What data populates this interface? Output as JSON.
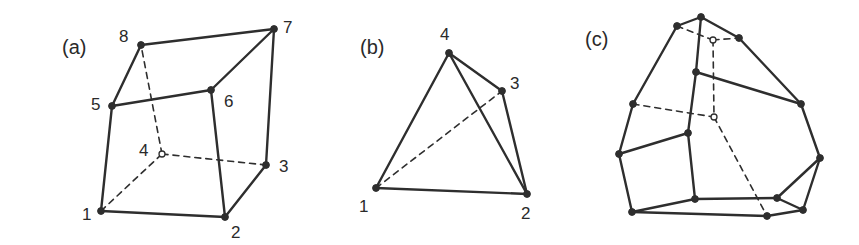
{
  "figure": {
    "stroke_color": "#2e2e2e",
    "panels": [
      {
        "id": "a",
        "label": "(a)",
        "label_pos": [
          62,
          54
        ],
        "shape": "hexahedron",
        "vertices": [
          {
            "id": "1",
            "x": 101,
            "y": 211,
            "hollow": false,
            "label": "1",
            "lx": 82,
            "ly": 220
          },
          {
            "id": "2",
            "x": 225,
            "y": 217,
            "hollow": false,
            "label": "2",
            "lx": 231,
            "ly": 238
          },
          {
            "id": "3",
            "x": 266,
            "y": 165,
            "hollow": false,
            "label": "3",
            "lx": 279,
            "ly": 172
          },
          {
            "id": "4",
            "x": 162,
            "y": 154,
            "hollow": true,
            "label": "4",
            "lx": 139,
            "ly": 156
          },
          {
            "id": "5",
            "x": 112,
            "y": 106,
            "hollow": false,
            "label": "5",
            "lx": 91,
            "ly": 110
          },
          {
            "id": "6",
            "x": 211,
            "y": 90,
            "hollow": false,
            "label": "6",
            "lx": 224,
            "ly": 107
          },
          {
            "id": "7",
            "x": 274,
            "y": 29,
            "hollow": false,
            "label": "7",
            "lx": 283,
            "ly": 33
          },
          {
            "id": "8",
            "x": 141,
            "y": 45,
            "hollow": false,
            "label": "8",
            "lx": 119,
            "ly": 42
          }
        ],
        "edges": [
          {
            "from": "1",
            "to": "2",
            "dashed": false
          },
          {
            "from": "2",
            "to": "3",
            "dashed": false
          },
          {
            "from": "1",
            "to": "5",
            "dashed": false
          },
          {
            "from": "2",
            "to": "6",
            "dashed": false
          },
          {
            "from": "3",
            "to": "7",
            "dashed": false
          },
          {
            "from": "5",
            "to": "6",
            "dashed": false
          },
          {
            "from": "6",
            "to": "7",
            "dashed": false
          },
          {
            "from": "7",
            "to": "8",
            "dashed": false
          },
          {
            "from": "8",
            "to": "5",
            "dashed": false
          },
          {
            "from": "1",
            "to": "4",
            "dashed": true
          },
          {
            "from": "4",
            "to": "3",
            "dashed": true
          },
          {
            "from": "4",
            "to": "8",
            "dashed": true
          }
        ]
      },
      {
        "id": "b",
        "label": "(b)",
        "label_pos": [
          360,
          54
        ],
        "shape": "tetrahedron",
        "vertices": [
          {
            "id": "1",
            "x": 376,
            "y": 188,
            "hollow": false,
            "label": "1",
            "lx": 359,
            "ly": 212
          },
          {
            "id": "2",
            "x": 527,
            "y": 194,
            "hollow": false,
            "label": "2",
            "lx": 521,
            "ly": 219
          },
          {
            "id": "3",
            "x": 502,
            "y": 91,
            "hollow": false,
            "label": "3",
            "lx": 510,
            "ly": 89
          },
          {
            "id": "4",
            "x": 449,
            "y": 53,
            "hollow": false,
            "label": "4",
            "lx": 440,
            "ly": 40
          }
        ],
        "edges": [
          {
            "from": "1",
            "to": "2",
            "dashed": false
          },
          {
            "from": "1",
            "to": "4",
            "dashed": false
          },
          {
            "from": "4",
            "to": "2",
            "dashed": false
          },
          {
            "from": "4",
            "to": "3",
            "dashed": false
          },
          {
            "from": "3",
            "to": "2",
            "dashed": false
          },
          {
            "from": "1",
            "to": "3",
            "dashed": true
          }
        ]
      },
      {
        "id": "c",
        "label": "(c)",
        "label_pos": [
          585,
          46
        ],
        "shape": "polyhedron",
        "vertices": [
          {
            "id": "A",
            "x": 701,
            "y": 17,
            "hollow": false
          },
          {
            "id": "B",
            "x": 677,
            "y": 26,
            "hollow": false
          },
          {
            "id": "C",
            "x": 713,
            "y": 40,
            "hollow": true
          },
          {
            "id": "D",
            "x": 739,
            "y": 38,
            "hollow": false
          },
          {
            "id": "E",
            "x": 696,
            "y": 72,
            "hollow": false
          },
          {
            "id": "F",
            "x": 633,
            "y": 104,
            "hollow": false
          },
          {
            "id": "G",
            "x": 714,
            "y": 117,
            "hollow": true
          },
          {
            "id": "H",
            "x": 801,
            "y": 104,
            "hollow": false
          },
          {
            "id": "I",
            "x": 688,
            "y": 133,
            "hollow": false
          },
          {
            "id": "J",
            "x": 619,
            "y": 154,
            "hollow": false
          },
          {
            "id": "K",
            "x": 820,
            "y": 158,
            "hollow": false
          },
          {
            "id": "L",
            "x": 695,
            "y": 199,
            "hollow": false
          },
          {
            "id": "M",
            "x": 777,
            "y": 198,
            "hollow": false
          },
          {
            "id": "N",
            "x": 632,
            "y": 212,
            "hollow": false
          },
          {
            "id": "O",
            "x": 767,
            "y": 216,
            "hollow": false
          },
          {
            "id": "P",
            "x": 803,
            "y": 210,
            "hollow": false
          }
        ],
        "edges": [
          {
            "from": "B",
            "to": "A",
            "dashed": false
          },
          {
            "from": "A",
            "to": "D",
            "dashed": false
          },
          {
            "from": "B",
            "to": "F",
            "dashed": false
          },
          {
            "from": "A",
            "to": "E",
            "dashed": false
          },
          {
            "from": "E",
            "to": "I",
            "dashed": false
          },
          {
            "from": "E",
            "to": "H",
            "dashed": false
          },
          {
            "from": "D",
            "to": "H",
            "dashed": false
          },
          {
            "from": "H",
            "to": "K",
            "dashed": false
          },
          {
            "from": "F",
            "to": "J",
            "dashed": false
          },
          {
            "from": "J",
            "to": "I",
            "dashed": false
          },
          {
            "from": "I",
            "to": "L",
            "dashed": false
          },
          {
            "from": "J",
            "to": "N",
            "dashed": false
          },
          {
            "from": "N",
            "to": "L",
            "dashed": false
          },
          {
            "from": "L",
            "to": "M",
            "dashed": false
          },
          {
            "from": "N",
            "to": "O",
            "dashed": false
          },
          {
            "from": "O",
            "to": "P",
            "dashed": false
          },
          {
            "from": "M",
            "to": "P",
            "dashed": false
          },
          {
            "from": "M",
            "to": "K",
            "dashed": false
          },
          {
            "from": "K",
            "to": "P",
            "dashed": false
          },
          {
            "from": "B",
            "to": "C",
            "dashed": true
          },
          {
            "from": "C",
            "to": "D",
            "dashed": true
          },
          {
            "from": "C",
            "to": "G",
            "dashed": true
          },
          {
            "from": "F",
            "to": "G",
            "dashed": true
          },
          {
            "from": "G",
            "to": "O",
            "dashed": true
          }
        ]
      }
    ]
  }
}
